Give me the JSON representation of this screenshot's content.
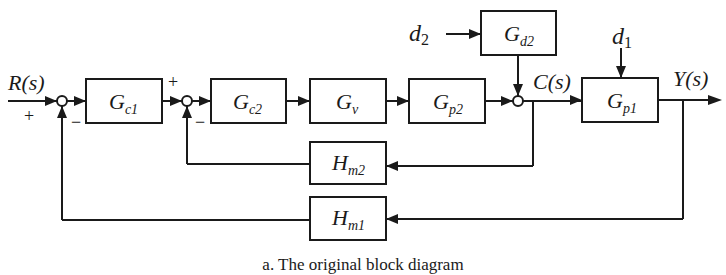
{
  "diagram": {
    "caption": "a. The original block diagram",
    "signals": {
      "input": "R(s)",
      "intermediate": "C(s)",
      "output": "Y(s)",
      "disturbance_2": "d",
      "disturbance_2_sub": "2",
      "disturbance_1": "d",
      "disturbance_1_sub": "1"
    },
    "blocks": [
      {
        "id": "gc1",
        "main": "G",
        "sub": "c1"
      },
      {
        "id": "gc2",
        "main": "G",
        "sub": "c2"
      },
      {
        "id": "gv",
        "main": "G",
        "sub": "v"
      },
      {
        "id": "gp2",
        "main": "G",
        "sub": "p2"
      },
      {
        "id": "gd2",
        "main": "G",
        "sub": "d2"
      },
      {
        "id": "gp1",
        "main": "G",
        "sub": "p1"
      },
      {
        "id": "hm2",
        "main": "H",
        "sub": "m2"
      },
      {
        "id": "hm1",
        "main": "H",
        "sub": "m1"
      }
    ],
    "summing_junctions": [
      {
        "id": "sum1",
        "signs": {
          "input": "+",
          "feedback": "−"
        }
      },
      {
        "id": "sum2",
        "signs": {
          "input": "+",
          "feedback": "−"
        }
      },
      {
        "id": "sum3",
        "signs": {}
      }
    ]
  }
}
